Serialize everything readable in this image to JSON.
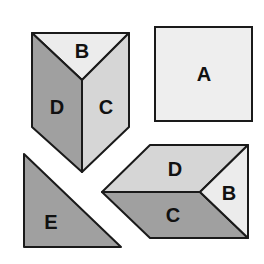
{
  "diagram": {
    "colors": {
      "background": "#ffffff",
      "stroke": "#1a1a1a",
      "face_lightest": "#ececec",
      "face_light": "#d6d6d6",
      "face_medium": "#a0a0a0",
      "square_fill": "#eeeeee"
    },
    "shapes": {
      "standing_prism": {
        "faces": {
          "top": {
            "label": "B",
            "fill": "#ececec"
          },
          "left": {
            "label": "D",
            "fill": "#a0a0a0"
          },
          "right": {
            "label": "C",
            "fill": "#d6d6d6"
          }
        }
      },
      "square": {
        "label": "A",
        "fill": "#eeeeee"
      },
      "triangle": {
        "label": "E",
        "fill": "#a0a0a0"
      },
      "lying_prism": {
        "faces": {
          "top": {
            "label": "D",
            "fill": "#d6d6d6"
          },
          "bottom": {
            "label": "C",
            "fill": "#a0a0a0"
          },
          "end": {
            "label": "B",
            "fill": "#ececec"
          }
        }
      }
    }
  }
}
